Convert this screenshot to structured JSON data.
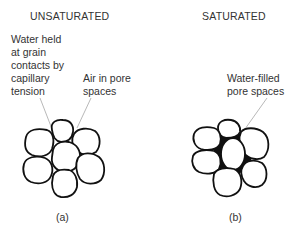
{
  "panels": [
    {
      "id": "a",
      "title": "UNSATURATED",
      "caption": "(a)",
      "labels": [
        {
          "name": "water-held-label",
          "text": "Water held\nat grain\ncontacts by\ncapillary\ntension"
        },
        {
          "name": "air-pores-label",
          "text": "Air in pore\nspaces"
        }
      ]
    },
    {
      "id": "b",
      "title": "SATURATED",
      "caption": "(b)",
      "labels": [
        {
          "name": "water-filled-label",
          "text": "Water-filled\npore spaces"
        }
      ]
    }
  ],
  "colors": {
    "stroke": "#111111",
    "leader": "#888888",
    "fill_water": "#111111",
    "grain_fill": "#ffffff"
  }
}
